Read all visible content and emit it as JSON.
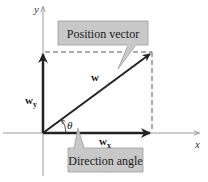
{
  "diagram": {
    "type": "vector-components",
    "axes": {
      "x_label": "x",
      "y_label": "y"
    },
    "vectors": {
      "main": {
        "label": "w"
      },
      "x_component": {
        "label": "w",
        "subscript": "x"
      },
      "y_component": {
        "label": "w",
        "subscript": "y"
      }
    },
    "angle": {
      "symbol": "θ"
    },
    "callouts": {
      "position_vector": "Position vector",
      "direction_angle": "Direction angle"
    },
    "colors": {
      "axis": "#9a9a9a",
      "vector": "#222222",
      "dashed": "#555555",
      "callout_fill": "#c8c8c8",
      "callout_stroke": "#9e9e9e"
    }
  }
}
